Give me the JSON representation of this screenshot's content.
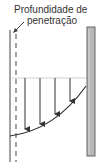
{
  "diagram": {
    "label_line1": "Profundidade de",
    "label_line2": "penetração",
    "colors": {
      "line": "#333333",
      "bar_fill": "#b8b8b8",
      "bar_stroke": "#555555",
      "guide": "#cccccc"
    },
    "arrows": [
      {
        "x": 25,
        "y_tip": 130
      },
      {
        "x": 40,
        "y_tip": 125
      },
      {
        "x": 55,
        "y_tip": 115
      },
      {
        "x": 70,
        "y_tip": 102
      }
    ]
  }
}
